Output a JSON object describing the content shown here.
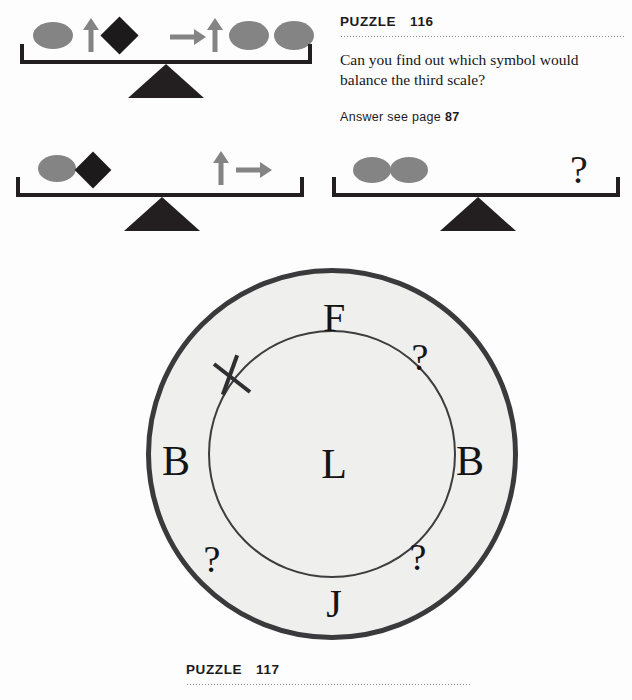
{
  "page": {
    "background_color": "#fdfdfd",
    "width": 632,
    "height": 700
  },
  "header": {
    "label": "PUZZLE",
    "number": "116"
  },
  "footer": {
    "label": "PUZZLE",
    "number": "117"
  },
  "prompt": {
    "line1": "Can you find out which symbol would",
    "line2": "balance the third scale?"
  },
  "answer": {
    "prefix": "Answer see page",
    "page": "87"
  },
  "colors": {
    "ink": "#231f20",
    "gray_shape": "#848484",
    "dark_shape": "#1c1a1b",
    "ring_stroke": "#3a3a3c",
    "ring_fill": "#efefee"
  },
  "scales": [
    {
      "name": "scale-1",
      "left_items": [
        "ellipse",
        "arrow-up",
        "diamond"
      ],
      "right_items": [
        "arrow-right",
        "arrow-up",
        "ellipse",
        "ellipse"
      ]
    },
    {
      "name": "scale-2",
      "left_items": [
        "ellipse",
        "diamond"
      ],
      "right_items": [
        "arrow-up",
        "arrow-right"
      ]
    },
    {
      "name": "scale-3",
      "left_items": [
        "ellipse",
        "ellipse"
      ],
      "right_items": [
        "question-mark"
      ],
      "question_mark": "?"
    }
  ],
  "circle_puzzle": {
    "center_letter": "L",
    "ring_positions": [
      {
        "slot": "top",
        "value": "F"
      },
      {
        "slot": "upper-right",
        "value": "?"
      },
      {
        "slot": "right",
        "value": "B"
      },
      {
        "slot": "lower-right",
        "value": "?"
      },
      {
        "slot": "bottom",
        "value": "J"
      },
      {
        "slot": "lower-left",
        "value": "?"
      },
      {
        "slot": "left",
        "value": "B"
      },
      {
        "slot": "upper-left",
        "value": "tick-mark"
      }
    ]
  }
}
